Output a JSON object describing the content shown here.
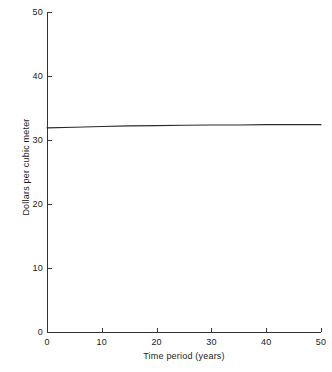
{
  "chart_data": {
    "type": "line",
    "title": "",
    "subtitle": "",
    "xlabel": "Time period (years)",
    "ylabel": "Dollars per cubic meter",
    "xlim": [
      0,
      50
    ],
    "ylim": [
      0,
      50
    ],
    "xticks": [
      0,
      10,
      20,
      30,
      40,
      50
    ],
    "yticks": [
      0,
      10,
      20,
      30,
      40,
      50
    ],
    "xtick_labels": [
      "0",
      "10",
      "20",
      "30",
      "40",
      "50"
    ],
    "ytick_labels": [
      "0",
      "10",
      "20",
      "30",
      "40",
      "50"
    ],
    "grid": false,
    "legend": false,
    "legend_position": "none",
    "annotations": [],
    "series": [
      {
        "name": "Dollars per cubic meter",
        "color": "#2b2b2b",
        "x": [
          0,
          5,
          10,
          15,
          20,
          25,
          30,
          35,
          40,
          45,
          50
        ],
        "values": [
          31.9,
          32.0,
          32.1,
          32.2,
          32.25,
          32.3,
          32.35,
          32.35,
          32.4,
          32.4,
          32.4
        ]
      }
    ]
  },
  "axes": {
    "x_title": "Time period (years)",
    "y_title": "Dollars per cubic meter"
  },
  "colors": {
    "axis": "#333333",
    "line": "#2b2b2b",
    "background": "#ffffff",
    "text": "#1a1a1a"
  }
}
